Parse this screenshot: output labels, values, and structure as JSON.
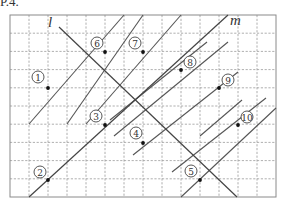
{
  "header": {
    "mark": "P.4."
  },
  "grid": {
    "x0": 10,
    "y0": 15,
    "x1": 276,
    "y1": 197,
    "cols": 14,
    "rows": 10
  },
  "lines": {
    "l": {
      "label": "l",
      "x1": 59,
      "y1": 27,
      "x2": 237,
      "y2": 197,
      "label_x": 48,
      "label_y": 27
    },
    "m": {
      "label": "m",
      "x1": 29,
      "y1": 197,
      "x2": 228,
      "y2": 15,
      "label_x": 230,
      "label_y": 25
    }
  },
  "parallel_segments": [
    {
      "x1": 29,
      "y1": 124,
      "x2": 124,
      "y2": 15
    },
    {
      "x1": 67,
      "y1": 124,
      "x2": 143,
      "y2": 15
    },
    {
      "x1": 86,
      "y1": 124,
      "x2": 181,
      "y2": 15
    },
    {
      "x1": 110,
      "y1": 120,
      "x2": 207,
      "y2": 42
    },
    {
      "x1": 114,
      "y1": 136,
      "x2": 228,
      "y2": 42
    },
    {
      "x1": 133,
      "y1": 155,
      "x2": 238,
      "y2": 72
    },
    {
      "x1": 172,
      "y1": 172,
      "x2": 266,
      "y2": 98
    },
    {
      "x1": 181,
      "y1": 197,
      "x2": 276,
      "y2": 108
    },
    {
      "x1": 200,
      "y1": 136,
      "x2": 242,
      "y2": 100
    }
  ],
  "points": [
    {
      "id": "1",
      "label": "①",
      "x": 48,
      "y": 88,
      "lx": 38,
      "ly": 77
    },
    {
      "id": "2",
      "label": "②",
      "x": 48,
      "y": 180,
      "lx": 40,
      "ly": 172
    },
    {
      "id": "3",
      "label": "③",
      "x": 105,
      "y": 125,
      "lx": 96,
      "ly": 116
    },
    {
      "id": "4",
      "label": "④",
      "x": 143,
      "y": 143,
      "lx": 136,
      "ly": 133
    },
    {
      "id": "5",
      "label": "⑤",
      "x": 200,
      "y": 180,
      "lx": 191,
      "ly": 171
    },
    {
      "id": "6",
      "label": "⑥",
      "x": 105,
      "y": 52,
      "lx": 97,
      "ly": 43
    },
    {
      "id": "7",
      "label": "⑦",
      "x": 143,
      "y": 52,
      "lx": 135,
      "ly": 43
    },
    {
      "id": "8",
      "label": "⑧",
      "x": 181,
      "y": 70,
      "lx": 190,
      "ly": 62
    },
    {
      "id": "9",
      "label": "⑨",
      "x": 219,
      "y": 88,
      "lx": 228,
      "ly": 80
    },
    {
      "id": "10",
      "label": "⑩",
      "x": 238,
      "y": 125,
      "lx": 247,
      "ly": 117
    }
  ]
}
